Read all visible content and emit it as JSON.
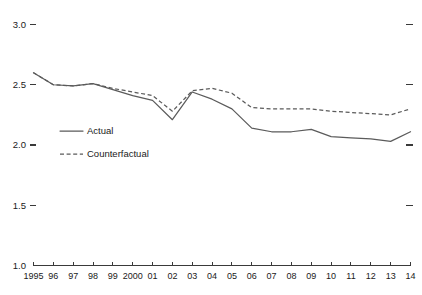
{
  "chart_data": {
    "type": "line",
    "title": "",
    "subtitle": "",
    "xlabel": "",
    "ylabel": "",
    "ylim": [
      1.0,
      3.0
    ],
    "yticks": [
      1.0,
      1.5,
      2.0,
      2.5,
      3.0
    ],
    "ytick_labels": [
      "1.0",
      "1.5",
      "2.0",
      "2.5",
      "3.0"
    ],
    "right_axis_ticks": [
      1.5,
      2.0,
      2.5,
      3.0
    ],
    "grid": false,
    "legend_position": "inside-left",
    "categories": [
      1995,
      1996,
      1997,
      1998,
      1999,
      2000,
      2001,
      2002,
      2003,
      2004,
      2005,
      2006,
      2007,
      2008,
      2009,
      2010,
      2011,
      2012,
      2013,
      2014
    ],
    "xtick_labels": [
      "1995",
      "96",
      "97",
      "98",
      "99",
      "2000",
      "01",
      "02",
      "03",
      "04",
      "05",
      "06",
      "07",
      "08",
      "09",
      "10",
      "11",
      "12",
      "13",
      "14"
    ],
    "series": [
      {
        "name": "Actual",
        "style": "solid",
        "color": "#5b5b5b",
        "values": [
          2.6,
          2.5,
          2.49,
          2.51,
          2.46,
          2.41,
          2.37,
          2.21,
          2.44,
          2.38,
          2.3,
          2.14,
          2.11,
          2.11,
          2.13,
          2.07,
          2.06,
          2.05,
          2.03,
          2.11
        ]
      },
      {
        "name": "Counterfactual",
        "style": "dashed",
        "color": "#5b5b5b",
        "values": [
          2.6,
          2.5,
          2.49,
          2.51,
          2.47,
          2.44,
          2.41,
          2.28,
          2.45,
          2.47,
          2.43,
          2.31,
          2.3,
          2.3,
          2.3,
          2.28,
          2.27,
          2.26,
          2.25,
          2.3
        ]
      }
    ]
  },
  "legend": {
    "items": [
      {
        "label": "Actual",
        "style": "solid"
      },
      {
        "label": "Counterfactual",
        "style": "dashed"
      }
    ]
  }
}
